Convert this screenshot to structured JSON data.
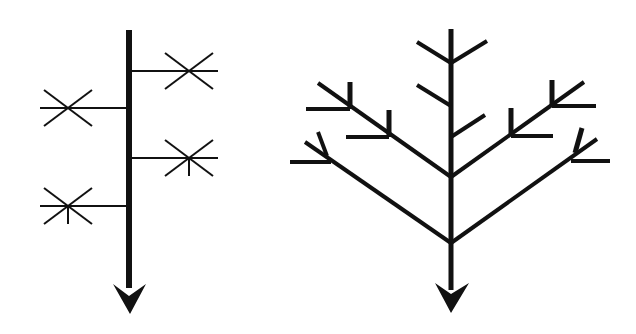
{
  "colors": {
    "background": "#ffffff",
    "stroke": "#111111"
  },
  "diagrams": [
    {
      "id": "monopodial",
      "label": "Monopodial branching diagram",
      "stem": {
        "x1": 129,
        "y1": 30,
        "x2": 129,
        "y2": 288,
        "width": 6
      },
      "arrowhead": {
        "points": "113,284 129,296 146,284 130,314"
      },
      "branches": [
        {
          "x1": 129,
          "y1": 71,
          "x2": 218,
          "y2": 71,
          "width": 2
        },
        {
          "x1": 127,
          "y1": 108,
          "x2": 40,
          "y2": 108,
          "width": 2
        },
        {
          "x1": 129,
          "y1": 158,
          "x2": 218,
          "y2": 158,
          "width": 2
        },
        {
          "x1": 127,
          "y1": 206,
          "x2": 40,
          "y2": 206,
          "width": 2
        }
      ],
      "stars": [
        {
          "cx": 189,
          "cy": 71,
          "dx": 24,
          "dy": 18,
          "tick": false
        },
        {
          "cx": 68,
          "cy": 108,
          "dx": 24,
          "dy": 18,
          "tick": false
        },
        {
          "cx": 189,
          "cy": 158,
          "dx": 24,
          "dy": 18,
          "tick": true,
          "tickLen": 18
        },
        {
          "cx": 68,
          "cy": 206,
          "dx": 24,
          "dy": 18,
          "tick": true,
          "tickLen": 18
        }
      ]
    },
    {
      "id": "sympodial",
      "label": "Sympodial / dichotomous branching diagram",
      "arrowhead": {
        "points": "435,283 451,294 469,283 451,313"
      },
      "segments": [
        {
          "x1": 451,
          "y1": 29,
          "x2": 451,
          "y2": 290,
          "width": 5
        },
        {
          "x1": 451,
          "y1": 63,
          "x2": 417,
          "y2": 42,
          "width": 4
        },
        {
          "x1": 451,
          "y1": 63,
          "x2": 487,
          "y2": 41,
          "width": 4
        },
        {
          "x1": 451,
          "y1": 106,
          "x2": 417,
          "y2": 85,
          "width": 4
        },
        {
          "x1": 451,
          "y1": 137,
          "x2": 485,
          "y2": 115,
          "width": 4
        },
        {
          "x1": 451,
          "y1": 177,
          "x2": 318,
          "y2": 83,
          "width": 4
        },
        {
          "x1": 451,
          "y1": 177,
          "x2": 584,
          "y2": 82,
          "width": 4
        },
        {
          "x1": 451,
          "y1": 243,
          "x2": 305,
          "y2": 142,
          "width": 4
        },
        {
          "x1": 451,
          "y1": 243,
          "x2": 597,
          "y2": 139,
          "width": 4
        },
        {
          "x1": 350,
          "y1": 109,
          "x2": 350,
          "y2": 82,
          "width": 5
        },
        {
          "x1": 350,
          "y1": 109,
          "x2": 306,
          "y2": 109,
          "width": 4
        },
        {
          "x1": 389,
          "y1": 137,
          "x2": 389,
          "y2": 110,
          "width": 5
        },
        {
          "x1": 389,
          "y1": 137,
          "x2": 346,
          "y2": 137,
          "width": 4
        },
        {
          "x1": 552,
          "y1": 106,
          "x2": 552,
          "y2": 80,
          "width": 5
        },
        {
          "x1": 552,
          "y1": 106,
          "x2": 596,
          "y2": 106,
          "width": 4
        },
        {
          "x1": 511,
          "y1": 136,
          "x2": 511,
          "y2": 108,
          "width": 5
        },
        {
          "x1": 511,
          "y1": 136,
          "x2": 553,
          "y2": 136,
          "width": 4
        },
        {
          "x1": 331,
          "y1": 162,
          "x2": 290,
          "y2": 162,
          "width": 4
        },
        {
          "x1": 327,
          "y1": 156,
          "x2": 318,
          "y2": 132,
          "width": 4
        },
        {
          "x1": 571,
          "y1": 161,
          "x2": 610,
          "y2": 161,
          "width": 4
        },
        {
          "x1": 575,
          "y1": 153,
          "x2": 582,
          "y2": 128,
          "width": 5
        }
      ]
    }
  ]
}
